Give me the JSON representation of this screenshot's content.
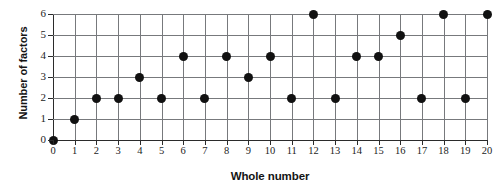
{
  "chart_data": {
    "type": "scatter",
    "title": "",
    "xlabel": "Whole number",
    "ylabel": "Number of factors",
    "x": [
      0,
      1,
      2,
      3,
      4,
      5,
      6,
      7,
      8,
      9,
      10,
      11,
      12,
      13,
      14,
      15,
      16,
      17,
      18,
      19,
      20
    ],
    "values": [
      0,
      1,
      2,
      2,
      3,
      2,
      4,
      2,
      4,
      3,
      4,
      2,
      6,
      2,
      4,
      4,
      5,
      2,
      6,
      2,
      6
    ],
    "xlim": [
      0,
      20
    ],
    "ylim": [
      0,
      6
    ],
    "x_ticks": [
      "0",
      "1",
      "2",
      "3",
      "4",
      "5",
      "6",
      "7",
      "8",
      "9",
      "10",
      "11",
      "12",
      "13",
      "14",
      "15",
      "16",
      "17",
      "18",
      "19",
      "20"
    ],
    "y_ticks": [
      "0",
      "1",
      "2",
      "3",
      "4",
      "5",
      "6"
    ],
    "grid": true,
    "legend": null,
    "marker": "filled-circle",
    "marker_color": "#111111",
    "grid_color": "#77797c",
    "axis_color": "#2b2b2b",
    "background_color": "#ffffff"
  }
}
